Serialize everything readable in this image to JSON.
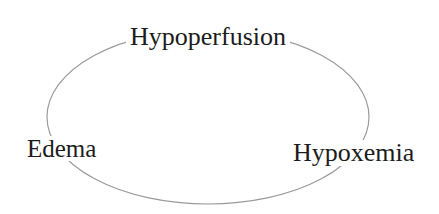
{
  "diagram": {
    "type": "cycle",
    "nodes": [
      {
        "id": "hypoperfusion",
        "label": "Hypoperfusion",
        "position": "top"
      },
      {
        "id": "edema",
        "label": "Edema",
        "position": "left"
      },
      {
        "id": "hypoxemia",
        "label": "Hypoxemia",
        "position": "right"
      }
    ],
    "connector": {
      "shape": "ellipse",
      "stroke_color": "#9a9a9a"
    },
    "text_color": "#1c1c1c",
    "background": "#ffffff"
  }
}
